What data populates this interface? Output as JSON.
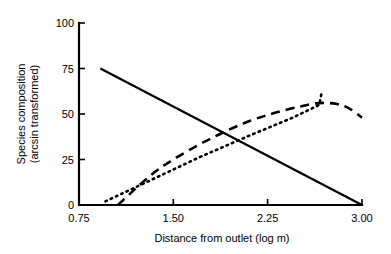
{
  "chart_data": {
    "type": "line",
    "title": "",
    "xlabel": "Distance from outlet (log m)",
    "ylabel": "Species composition\n(arcsin transformed)",
    "ylabel_line1": "Species composition",
    "ylabel_line2": "(arcsin transformed)",
    "xlim": [
      0.75,
      3.0
    ],
    "ylim": [
      0,
      100
    ],
    "xticks": [
      0.75,
      1.5,
      2.25,
      3.0
    ],
    "xtick_labels": [
      "0.75",
      "1.50",
      "2.25",
      "3.00"
    ],
    "yticks": [
      0,
      25,
      50,
      75,
      100
    ],
    "ytick_labels": [
      "0",
      "25",
      "50",
      "75",
      "100"
    ],
    "grid": false,
    "legend": "none",
    "series": [
      {
        "name": "solid-line",
        "style": "solid",
        "x": [
          0.92,
          3.0
        ],
        "values": [
          75,
          0
        ]
      },
      {
        "name": "dashed-curve",
        "style": "dashed",
        "x": [
          1.06,
          1.2,
          1.35,
          1.5,
          1.7,
          1.9,
          2.1,
          2.3,
          2.5,
          2.66,
          2.8,
          2.9,
          3.0
        ],
        "values": [
          0,
          9,
          18,
          25,
          33,
          40,
          46,
          50.5,
          54,
          56,
          55.5,
          53,
          48
        ]
      },
      {
        "name": "dotted-line",
        "style": "dotted",
        "x": [
          0.96,
          1.3,
          1.7,
          2.1,
          2.45,
          2.66,
          2.68
        ],
        "values": [
          2,
          13,
          26,
          38,
          48,
          55,
          62
        ]
      }
    ]
  },
  "axis_color": "#000000",
  "background_color": "#ffffff"
}
